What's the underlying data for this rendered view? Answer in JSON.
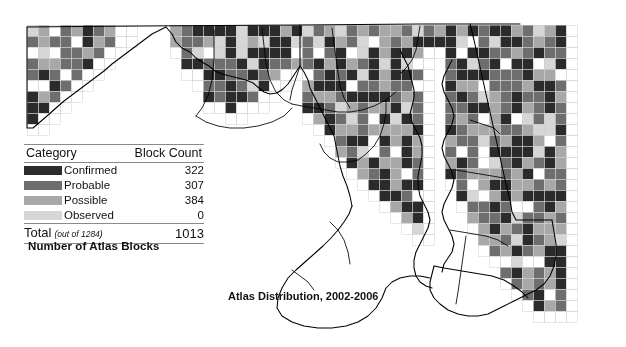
{
  "figure": {
    "map_caption": "Atlas Distribution, 2002-2006",
    "legend_caption": "Number of Atlas Blocks"
  },
  "legend": {
    "header": {
      "category": "Category",
      "count": "Block Count"
    },
    "rows": [
      {
        "label": "Confirmed",
        "count": "322",
        "color": "#2b2b2b"
      },
      {
        "label": "Probable",
        "count": "307",
        "color": "#6e6e6e"
      },
      {
        "label": "Possible",
        "count": "384",
        "color": "#a8a8a8"
      },
      {
        "label": "Observed",
        "count": "0",
        "color": "#d6d6d6"
      }
    ],
    "total": {
      "label": "Total",
      "paren": "(out of 1284)",
      "value": "1013"
    }
  },
  "chart_data": {
    "type": "heatmap",
    "title": "Atlas Distribution, 2002-2006",
    "subtitle": "Number of Atlas Blocks",
    "legend_title": "Category",
    "value_axis_label": "Block Count",
    "categories": [
      "Confirmed",
      "Probable",
      "Possible",
      "Observed"
    ],
    "values": [
      322,
      307,
      384,
      0
    ],
    "colors": [
      "#2b2b2b",
      "#6e6e6e",
      "#a8a8a8",
      "#d6d6d6"
    ],
    "total": 1013,
    "total_possible": 1284,
    "grid": {
      "cell_px": 11,
      "origin_x": 27,
      "origin_y": 25
    },
    "empty_color": "#ffffff",
    "grid_line_color": "#cfcfcf",
    "boundary_color": "#000000"
  }
}
